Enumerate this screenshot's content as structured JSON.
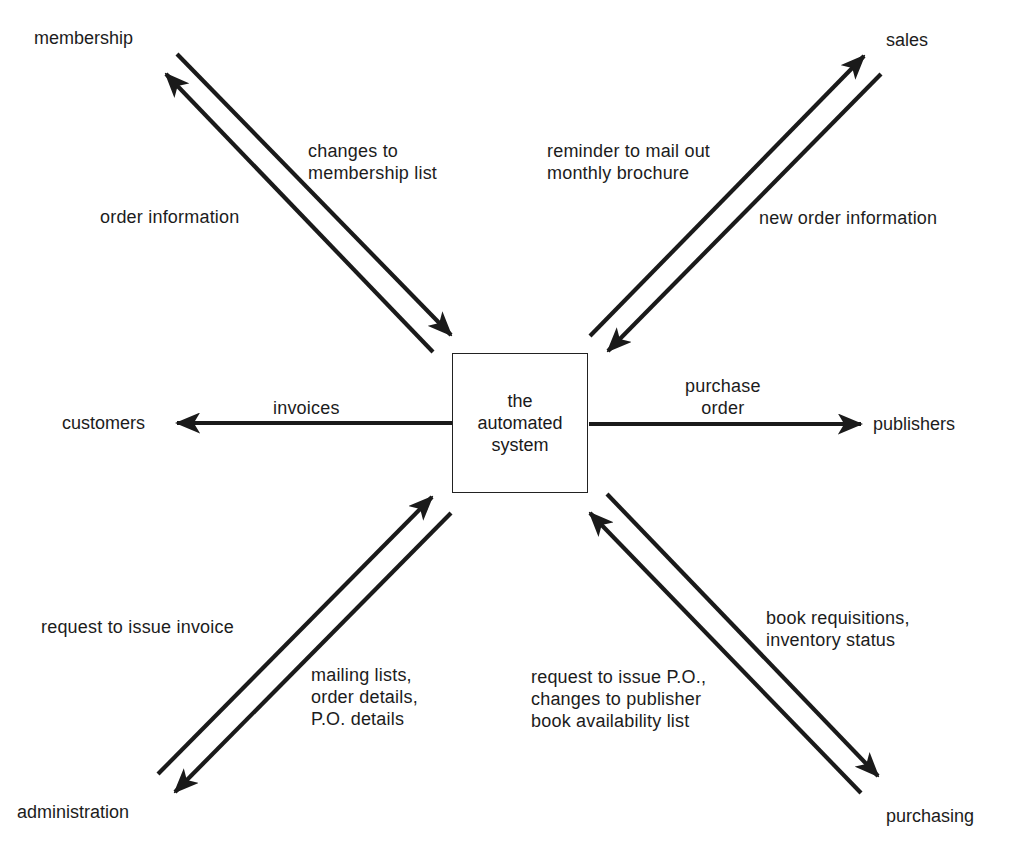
{
  "diagram": {
    "type": "context diagram",
    "center": {
      "label": "the\nautomated\nsystem"
    },
    "entities": {
      "membership": "membership",
      "sales": "sales",
      "customers": "customers",
      "publishers": "publishers",
      "administration": "administration",
      "purchasing": "purchasing"
    },
    "flows": {
      "changes_to_membership_list": {
        "label": "changes to\nmembership list",
        "from": "membership",
        "to": "the automated system"
      },
      "order_information": {
        "label": "order information",
        "from": "the automated system",
        "to": "membership"
      },
      "reminder_to_mail_out": {
        "label": "reminder to mail out\nmonthly brochure",
        "from": "the automated system",
        "to": "sales"
      },
      "new_order_information": {
        "label": "new order information",
        "from": "sales",
        "to": "the automated system"
      },
      "invoices": {
        "label": "invoices",
        "from": "the automated system",
        "to": "customers"
      },
      "purchase_order": {
        "label": "purchase\norder",
        "from": "the automated system",
        "to": "publishers"
      },
      "request_to_issue_invoice": {
        "label": "request to issue invoice",
        "from": "administration",
        "to": "the automated system"
      },
      "mailing_lists": {
        "label": "mailing lists,\norder details,\nP.O. details",
        "from": "the automated system",
        "to": "administration"
      },
      "book_requisitions": {
        "label": "book requisitions,\ninventory status",
        "from": "the automated system",
        "to": "purchasing"
      },
      "request_to_issue_po": {
        "label": "request to issue P.O.,\nchanges to publisher\nbook availability list",
        "from": "purchasing",
        "to": "the automated system"
      }
    },
    "colors": {
      "line": "#1a1a1a",
      "text": "#1c1c1c",
      "background": "#ffffff"
    }
  }
}
